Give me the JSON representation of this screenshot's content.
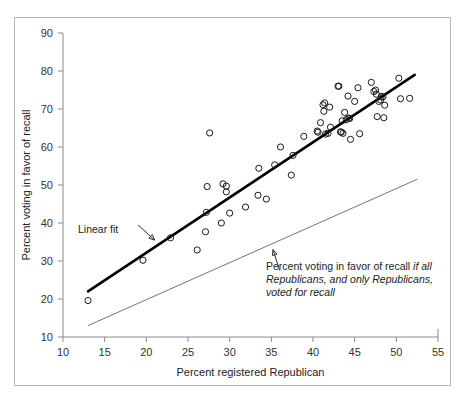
{
  "chart_data": {
    "type": "scatter",
    "title": "",
    "xlabel": "Percent registered Republican",
    "ylabel": "Percent voting in favor of recall",
    "xlim": [
      10,
      55
    ],
    "ylim": [
      10,
      90
    ],
    "xticks": [
      10,
      15,
      20,
      25,
      30,
      35,
      40,
      45,
      50,
      55
    ],
    "yticks": [
      10,
      20,
      30,
      40,
      50,
      60,
      70,
      80,
      90
    ],
    "grid": false,
    "legend": "none",
    "series": [
      {
        "name": "Counties",
        "marker": "open-circle",
        "points": [
          [
            13.0,
            19.6
          ],
          [
            19.6,
            30.2
          ],
          [
            22.9,
            36.1
          ],
          [
            26.1,
            32.9
          ],
          [
            27.1,
            37.7
          ],
          [
            27.3,
            49.6
          ],
          [
            27.2,
            42.8
          ],
          [
            27.6,
            63.7
          ],
          [
            29.0,
            40.0
          ],
          [
            29.2,
            50.3
          ],
          [
            29.6,
            49.7
          ],
          [
            29.6,
            48.2
          ],
          [
            30.0,
            42.6
          ],
          [
            31.9,
            44.2
          ],
          [
            33.4,
            47.3
          ],
          [
            33.5,
            54.4
          ],
          [
            34.4,
            46.3
          ],
          [
            35.4,
            55.3
          ],
          [
            36.1,
            60.0
          ],
          [
            37.4,
            52.6
          ],
          [
            37.6,
            57.8
          ],
          [
            38.9,
            62.8
          ],
          [
            40.5,
            64.2
          ],
          [
            40.6,
            63.9
          ],
          [
            40.9,
            66.4
          ],
          [
            41.2,
            71.1
          ],
          [
            41.3,
            69.4
          ],
          [
            41.4,
            71.6
          ],
          [
            41.5,
            63.4
          ],
          [
            41.8,
            63.6
          ],
          [
            42.0,
            70.5
          ],
          [
            42.1,
            65.2
          ],
          [
            43.0,
            76.0
          ],
          [
            43.1,
            76.0
          ],
          [
            43.3,
            64.0
          ],
          [
            43.4,
            63.9
          ],
          [
            43.5,
            66.9
          ],
          [
            43.6,
            63.6
          ],
          [
            43.8,
            69.1
          ],
          [
            44.0,
            67.2
          ],
          [
            44.2,
            73.4
          ],
          [
            44.3,
            67.6
          ],
          [
            44.4,
            67.5
          ],
          [
            44.5,
            62.0
          ],
          [
            45.0,
            72.0
          ],
          [
            45.4,
            75.6
          ],
          [
            45.6,
            63.5
          ],
          [
            47.0,
            77.0
          ],
          [
            47.3,
            74.6
          ],
          [
            47.5,
            75.0
          ],
          [
            47.6,
            73.9
          ],
          [
            47.7,
            68.0
          ],
          [
            47.9,
            72.0
          ],
          [
            48.1,
            72.4
          ],
          [
            48.2,
            73.3
          ],
          [
            48.4,
            73.2
          ],
          [
            48.5,
            67.7
          ],
          [
            48.6,
            71.0
          ],
          [
            50.3,
            78.1
          ],
          [
            50.5,
            72.7
          ],
          [
            51.6,
            72.8
          ]
        ]
      }
    ],
    "lines": [
      {
        "name": "Linear fit",
        "style": "thick-black",
        "x1": 13.0,
        "y1": 22.0,
        "x2": 52.2,
        "y2": 79.0
      },
      {
        "name": "All-Republicans reference",
        "style": "thin-gray",
        "x1": 13.0,
        "y1": 13.0,
        "x2": 52.5,
        "y2": 51.5
      }
    ],
    "annotations": [
      {
        "id": "linear-fit",
        "text": "Linear fit",
        "arrow_from": [
          19.0,
          39.5
        ],
        "arrow_to": [
          21.0,
          35.5
        ]
      },
      {
        "id": "reference-line",
        "text_line1_plain": "Percent voting in favor of recall ",
        "text_line1_italic": "if all",
        "text_line2_italic": "Republicans, and only Republicans,",
        "text_line3_italic": "voted for recall",
        "arrow_from": [
          36.0,
          27.5
        ],
        "arrow_to": [
          35.2,
          33.0
        ]
      }
    ]
  },
  "axes": {
    "x": {
      "label": "Percent registered Republican",
      "ticks": [
        "10",
        "15",
        "20",
        "25",
        "30",
        "35",
        "40",
        "45",
        "50",
        "55"
      ]
    },
    "y": {
      "label": "Percent voting in favor of recall",
      "ticks": [
        "10",
        "20",
        "30",
        "40",
        "50",
        "60",
        "70",
        "80",
        "90"
      ]
    }
  },
  "annotations": {
    "linear_fit_label": "Linear fit",
    "reference_label_plain": "Percent voting in favor of recall ",
    "reference_label_italic_1": "if all",
    "reference_label_italic_2": "Republicans, and only Republicans,",
    "reference_label_italic_3": "voted for recall"
  },
  "colors": {
    "axis": "#8a8a8a",
    "fit_line": "#000000",
    "reference_line": "#777777",
    "marker_stroke": "#1a1a1a",
    "border": "#b8b8b8",
    "background": "#ffffff"
  }
}
